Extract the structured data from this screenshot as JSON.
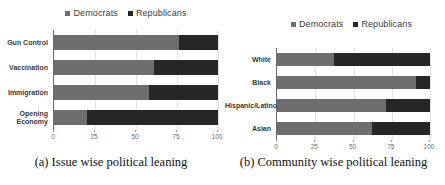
{
  "colors": {
    "democrats": "#6e6e6e",
    "republicans": "#262626",
    "grid_line": "#e2e2e2",
    "tick_label": "#6b6b6b",
    "category_label": "#3a3a3a"
  },
  "chart_data": [
    {
      "type": "bar",
      "orientation": "horizontal",
      "stacked": true,
      "caption": "(a) Issue wise political leaning",
      "categories": [
        "Gun Control",
        "Vaccination",
        "Immigration",
        "Opening Economy"
      ],
      "series": [
        {
          "name": "Democrats",
          "color": "#6e6e6e",
          "values": [
            76,
            61,
            58,
            20
          ]
        },
        {
          "name": "Republicans",
          "color": "#262626",
          "values": [
            24,
            39,
            42,
            80
          ]
        }
      ],
      "xlim": [
        0,
        100
      ],
      "xticks": [
        0,
        25,
        50,
        75,
        100
      ],
      "grid": true,
      "legend_position": "top"
    },
    {
      "type": "bar",
      "orientation": "horizontal",
      "stacked": true,
      "caption": "(b) Community wise political leaning",
      "categories": [
        "White",
        "Black",
        "Hispanic/Latino",
        "Asian"
      ],
      "series": [
        {
          "name": "Democrats",
          "color": "#6e6e6e",
          "values": [
            37,
            91,
            71,
            62
          ]
        },
        {
          "name": "Republicans",
          "color": "#262626",
          "values": [
            63,
            9,
            29,
            38
          ]
        }
      ],
      "xlim": [
        0,
        100
      ],
      "xticks": [
        0,
        25,
        50,
        75,
        100
      ],
      "grid": true,
      "legend_position": "top"
    }
  ]
}
